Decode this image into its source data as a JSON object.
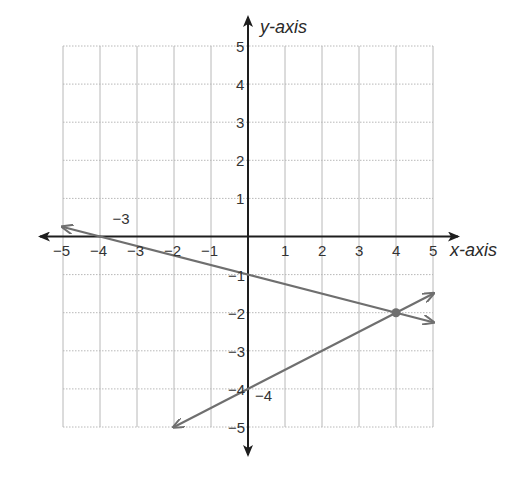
{
  "chart_data": {
    "type": "line",
    "title": "",
    "xlabel": "x-axis",
    "ylabel": "y-axis",
    "xlim": [
      -5,
      5
    ],
    "ylim": [
      -5,
      5
    ],
    "grid": true,
    "x_ticks": [
      -5,
      -4,
      -3,
      -2,
      -1,
      1,
      2,
      3,
      4,
      5
    ],
    "x_tick_labels": [
      "−5",
      "−4",
      "−3",
      "−2",
      "−1",
      "1",
      "2",
      "3",
      "4",
      "5"
    ],
    "y_ticks": [
      5,
      4,
      3,
      2,
      1,
      -1,
      -2,
      -3,
      -4,
      -5
    ],
    "y_tick_labels": [
      "5",
      "4",
      "3",
      "2",
      "1",
      "−1",
      "−2",
      "−3",
      "−4",
      "−5"
    ],
    "series": [
      {
        "name": "line-1",
        "equation": "y = -x/4 - 1",
        "points": [
          [
            -5,
            0.25
          ],
          [
            -4,
            0
          ],
          [
            0,
            -1
          ],
          [
            4,
            -2
          ],
          [
            5,
            -2.25
          ]
        ],
        "arrows_both_ends": true
      },
      {
        "name": "line-2",
        "equation": "y = x/2 - 4",
        "points": [
          [
            -2,
            -5
          ],
          [
            0,
            -4
          ],
          [
            4,
            -2
          ],
          [
            5,
            -1.5
          ]
        ],
        "arrows_both_ends": true
      }
    ],
    "annotations": [
      {
        "text": "−3",
        "x": -3.5,
        "y": 0.25
      },
      {
        "text": "−4",
        "x": 0.35,
        "y": -4.4
      }
    ],
    "intersection": {
      "x": 4,
      "y": -2
    }
  },
  "colors": {
    "axis": "#1e1e1e",
    "grid": "#b8b8b8",
    "line": "#6f6f6f",
    "text": "#333333"
  }
}
